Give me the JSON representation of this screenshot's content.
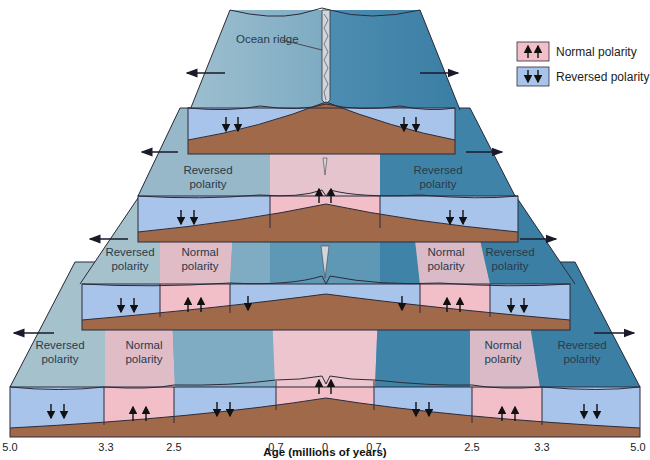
{
  "callout": {
    "ocean_ridge": "Ocean ridge"
  },
  "legend": {
    "normal": {
      "label": "Normal polarity",
      "color": "#f2bfc8",
      "icon": "up-arrows-icon"
    },
    "reversed": {
      "label": "Reversed polarity",
      "color": "#a9c4ea",
      "icon": "down-arrows-icon"
    }
  },
  "stage_labels": {
    "stage2": {
      "left": [
        "Reversed",
        "polarity"
      ],
      "right": [
        "Reversed",
        "polarity"
      ]
    },
    "stage3": {
      "left_rev": [
        "Reversed",
        "polarity"
      ],
      "left_norm": [
        "Normal",
        "polarity"
      ],
      "right_norm": [
        "Normal",
        "polarity"
      ],
      "right_rev": [
        "Reversed",
        "polarity"
      ]
    },
    "stage4": {
      "left_rev": [
        "Reversed",
        "polarity"
      ],
      "left_norm": [
        "Normal",
        "polarity"
      ],
      "right_norm": [
        "Normal",
        "polarity"
      ],
      "right_rev": [
        "Reversed",
        "polarity"
      ]
    }
  },
  "axis": {
    "label": "Age (millions of years)",
    "ticks": [
      "5.0",
      "3.3",
      "2.5",
      "0.7",
      "0",
      "0.7",
      "2.5",
      "3.3",
      "5.0"
    ]
  },
  "colors": {
    "rock": "#a0694a",
    "normal": "#f2bfc8",
    "reversed": "#a9c4ea",
    "seafloor_left": "#8fb5c4",
    "seafloor_right": "#3f84a8",
    "outline": "#2b2b3a"
  }
}
